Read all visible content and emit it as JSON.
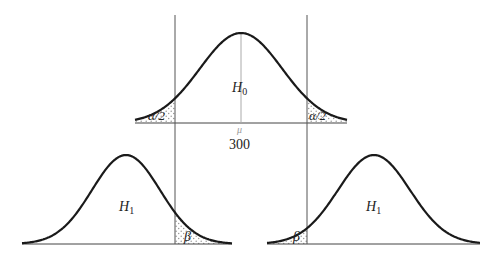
{
  "diagram": {
    "title": "",
    "critical_lines": {
      "left_x": 175,
      "right_x": 307,
      "top_y": 15,
      "bottom_y": 244
    },
    "colors": {
      "curve": "#1a1a1a",
      "axis": "#444444",
      "center_line": "#aaaaaa",
      "stipple": "#9a9a9a"
    },
    "null_distribution": {
      "label_main": "H",
      "label_sub": "0",
      "center_symbol": "μ",
      "center_value": "300",
      "cx": 241,
      "baseline": 123,
      "amplitude": 90,
      "sigma": 41,
      "x_min": 135,
      "x_max": 347,
      "left_tail_label": "α/2",
      "right_tail_label": "α/2"
    },
    "alt_left": {
      "label_main": "H",
      "label_sub": "1",
      "cx": 126,
      "baseline": 244,
      "amplitude": 89,
      "sigma": 34,
      "x_min": 22,
      "x_max": 232,
      "tail_label": "β",
      "tail_side": "right"
    },
    "alt_right": {
      "label_main": "H",
      "label_sub": "1",
      "cx": 374,
      "baseline": 244,
      "amplitude": 89,
      "sigma": 36,
      "x_min": 267,
      "x_max": 480,
      "tail_label": "β",
      "tail_side": "left"
    }
  }
}
